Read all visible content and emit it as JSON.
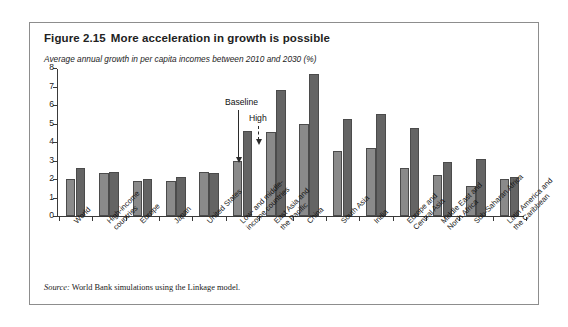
{
  "figure": {
    "number": "Figure 2.15",
    "title": "More acceleration in growth is possible",
    "subtitle": "Average annual growth in per capita incomes between 2010 and 2030 (%)",
    "source_word": "Source:",
    "source_text": " World Bank simulations using the Linkage model."
  },
  "annotations": {
    "baseline": "Baseline",
    "high": "High"
  },
  "colors": {
    "baseline_bar": "#8a8a8a",
    "high_bar": "#646464",
    "bar_border": "#4b4b4b",
    "axis": "#3a3a3a",
    "frame": "#8d8d8d"
  },
  "chart_data": {
    "type": "bar",
    "title": "More acceleration in growth is possible",
    "subtitle": "Average annual growth in per capita incomes between 2010 and 2030 (%)",
    "xlabel": "",
    "ylabel": "",
    "ylim": [
      0,
      8
    ],
    "yticks": [
      0,
      1,
      2,
      3,
      4,
      5,
      6,
      7,
      8
    ],
    "ytick_labels": [
      "0",
      "1",
      "2",
      "3",
      "4",
      "5",
      "6",
      "7",
      "8"
    ],
    "grid": false,
    "legend": "annotated (Baseline / High arrows)",
    "categories": [
      "World",
      "High-income\ncountries",
      "Europe",
      "Japan",
      "United States",
      "Low- and middle-\nincome countries",
      "East Asia and\nthe Pacific",
      "China",
      "South Asia",
      "India",
      "Europe and\nCentral Asia",
      "Middle East and\nNorth Africa",
      "Sub-Saharan Africa",
      "Latin America and\nthe Caribbean"
    ],
    "series": [
      {
        "name": "Baseline",
        "values": [
          2.0,
          2.3,
          1.9,
          1.9,
          2.4,
          3.0,
          4.55,
          4.95,
          3.5,
          3.7,
          2.6,
          2.2,
          1.6,
          2.0
        ]
      },
      {
        "name": "High",
        "values": [
          2.6,
          2.4,
          2.0,
          2.1,
          2.3,
          4.6,
          6.8,
          7.65,
          5.25,
          5.5,
          4.75,
          2.9,
          3.1,
          2.1
        ]
      }
    ]
  }
}
